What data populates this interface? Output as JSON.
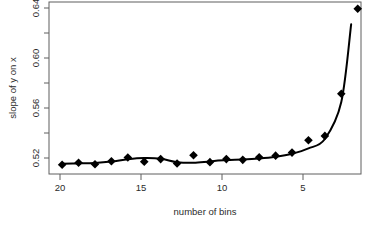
{
  "chart_data": {
    "type": "scatter",
    "title": "",
    "subtitle": "",
    "xlabel": "number of bins",
    "ylabel": "slope of y on x",
    "xlim": [
      20.8,
      1.8
    ],
    "ylim": [
      0.5115,
      0.6465
    ],
    "x_reversed": true,
    "grid": false,
    "legend": null,
    "legend_position": "none",
    "xticks": [
      20,
      15,
      10,
      5
    ],
    "xtick_labels": [
      "20",
      "15",
      "10",
      "5"
    ],
    "x_minor_ticks": [
      20,
      17.5,
      15,
      12.5,
      10,
      7.5,
      5,
      2.5
    ],
    "yticks": [
      0.52,
      0.56,
      0.6,
      0.64
    ],
    "ytick_labels": [
      "0.52",
      "0.56",
      "0.60",
      "0.64"
    ],
    "y_minor_ticks": [
      0.52,
      0.54,
      0.56,
      0.58,
      0.6,
      0.62,
      0.64
    ],
    "marker": "filled-diamond",
    "marker_color": "#000000",
    "line_color": "#000000",
    "series": [
      {
        "name": "observed slope",
        "kind": "points",
        "x": [
          20,
          19,
          18,
          17,
          16,
          15,
          14,
          13,
          12,
          11,
          10,
          9,
          8,
          7,
          6,
          5,
          4,
          3,
          2
        ],
        "values": [
          0.5188,
          0.5203,
          0.5192,
          0.5215,
          0.5245,
          0.5212,
          0.5232,
          0.5198,
          0.5262,
          0.5208,
          0.5232,
          0.5226,
          0.5247,
          0.5259,
          0.5283,
          0.538,
          0.5414,
          0.5745,
          0.6412
        ]
      },
      {
        "name": "smoothed fit",
        "kind": "line",
        "x": [
          20,
          19,
          18,
          17,
          16,
          15,
          14,
          13,
          12,
          11,
          10,
          9,
          8,
          7,
          6,
          5,
          4,
          3,
          2.4
        ],
        "values": [
          0.5196,
          0.5198,
          0.5202,
          0.5213,
          0.5231,
          0.524,
          0.5235,
          0.5208,
          0.5203,
          0.5214,
          0.5224,
          0.5228,
          0.5236,
          0.525,
          0.5274,
          0.5316,
          0.539,
          0.568,
          0.629
        ]
      }
    ]
  },
  "axes": {
    "ylabel": "slope of y on x",
    "xlabel": "number of bins",
    "ytick_labels": [
      "0.64",
      "0.60",
      "0.56",
      "0.52"
    ],
    "xtick_labels": [
      "20",
      "15",
      "10",
      "5"
    ]
  }
}
